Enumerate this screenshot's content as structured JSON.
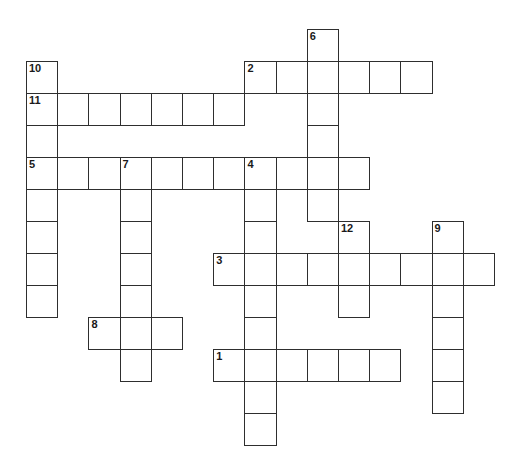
{
  "puzzle": {
    "type": "crossword",
    "grid_origin": {
      "x": 26,
      "y": 29
    },
    "cell_size": {
      "w": 31.2,
      "h": 32
    },
    "colors": {
      "border": "#2e2e2e",
      "fill": "#ffffff",
      "number": "#1a1a1a"
    },
    "entries": [
      {
        "number": "1",
        "direction": "across",
        "row": 10,
        "col": 6,
        "length": 6
      },
      {
        "number": "2",
        "direction": "across",
        "row": 1,
        "col": 7,
        "length": 6
      },
      {
        "number": "3",
        "direction": "across",
        "row": 7,
        "col": 6,
        "length": 9
      },
      {
        "number": "4",
        "direction": "down",
        "row": 4,
        "col": 7,
        "length": 9
      },
      {
        "number": "5",
        "direction": "across",
        "row": 4,
        "col": 0,
        "length": 11
      },
      {
        "number": "6",
        "direction": "down",
        "row": 0,
        "col": 9,
        "length": 6
      },
      {
        "number": "7",
        "direction": "down",
        "row": 4,
        "col": 3,
        "length": 7
      },
      {
        "number": "8",
        "direction": "across",
        "row": 9,
        "col": 2,
        "length": 3
      },
      {
        "number": "9",
        "direction": "down",
        "row": 6,
        "col": 13,
        "length": 6
      },
      {
        "number": "10",
        "direction": "down",
        "row": 1,
        "col": 0,
        "length": 8
      },
      {
        "number": "11",
        "direction": "across",
        "row": 2,
        "col": 0,
        "length": 7
      },
      {
        "number": "12",
        "direction": "down",
        "row": 6,
        "col": 10,
        "length": 3
      }
    ]
  }
}
